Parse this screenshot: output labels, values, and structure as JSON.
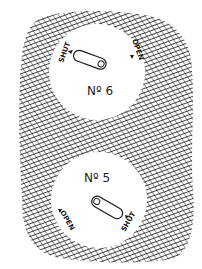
{
  "figure": {
    "colors": {
      "ink": "#1a1a1a",
      "paper": "#ffffff"
    }
  },
  "dials": [
    {
      "number_label": "Nº 6",
      "left_label": "SHUT",
      "right_label": "OPEN",
      "pointer": "toward SHUT (upper-left)"
    },
    {
      "number_label": "Nº 5",
      "left_label": "OPEN",
      "right_label": "SHUT",
      "pointer": "toward SHUT (lower-right)"
    }
  ]
}
